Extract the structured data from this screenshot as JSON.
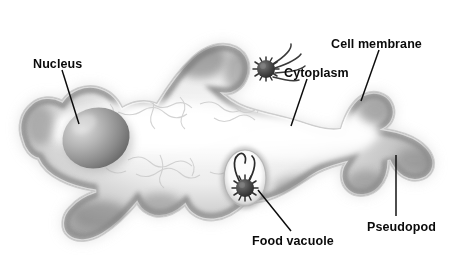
{
  "figure": {
    "background_color": "#ffffff",
    "width": 453,
    "height": 260,
    "style": "grayscale airbrushed biological illustration"
  },
  "labels": {
    "nucleus": "Nucleus",
    "cytoplasm": "Cytoplasm",
    "cell_membrane": "Cell membrane",
    "pseudopod": "Pseudopod",
    "food_vacuole": "Food vacuole"
  },
  "label_color": "#0a0a0a",
  "leader_color": "#0b0b0b",
  "structures": {
    "cell_body": {
      "name": "amoeba-cell-body",
      "fill_light": "#f2f2f2",
      "fill_mid": "#bfbfbf",
      "fill_dark": "#7d7d7d",
      "outline": "#cfcfcf"
    },
    "nucleus": {
      "name": "nucleus-organelle",
      "shape": "ellipse",
      "cx": 96,
      "cy": 138,
      "rx": 34,
      "ry": 30,
      "rotation": -20,
      "fill_light": "#d9d9d9",
      "fill_dark": "#6e6e6e"
    },
    "food_vacuole": {
      "name": "food-vacuole-organelle",
      "shape": "ellipse",
      "cx": 245,
      "cy": 178,
      "rx": 21,
      "ry": 28,
      "fill": "#fafafa",
      "ring": "#8c8c8c"
    },
    "ingested_microorganism": {
      "name": "ingested-microorganism",
      "cx": 245,
      "cy": 188,
      "radius": 9,
      "fill": "#4a4a4a",
      "spikes": 14
    },
    "free_microorganism": {
      "name": "free-microorganism",
      "cx": 266,
      "cy": 69,
      "radius": 9,
      "fill": "#3f3f3f",
      "spikes": 14,
      "flagella": 4
    },
    "cytoplasm_texture": {
      "name": "cytoplasm-network-texture",
      "stroke": "#d2d2d2"
    }
  },
  "leaders": [
    {
      "name": "nucleus-leader",
      "x1": 62,
      "y1": 70,
      "x2": 79,
      "y2": 124
    },
    {
      "name": "cytoplasm-leader",
      "x1": 307,
      "y1": 79,
      "x2": 291,
      "y2": 126
    },
    {
      "name": "cell-membrane-leader",
      "x1": 379,
      "y1": 50,
      "x2": 361,
      "y2": 101
    },
    {
      "name": "pseudopod-leader",
      "x1": 396,
      "y1": 155,
      "x2": 396,
      "y2": 216
    },
    {
      "name": "food-vacuole-leader",
      "x1": 258,
      "y1": 190,
      "x2": 291,
      "y2": 231
    }
  ],
  "label_positions": {
    "nucleus": {
      "x": 33,
      "y": 68,
      "anchor": "start"
    },
    "cytoplasm": {
      "x": 284,
      "y": 77,
      "anchor": "start"
    },
    "cell_membrane": {
      "x": 331,
      "y": 48,
      "anchor": "start"
    },
    "pseudopod": {
      "x": 367,
      "y": 231,
      "anchor": "start"
    },
    "food_vacuole": {
      "x": 252,
      "y": 245,
      "anchor": "start"
    }
  }
}
